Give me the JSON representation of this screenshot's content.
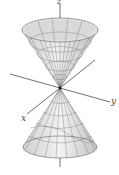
{
  "figure": {
    "type": "double-cone",
    "axes": {
      "z_label": "z",
      "y_label": "y",
      "x_label": "x"
    },
    "colors": {
      "surface_fill": "#d8d8d8",
      "surface_light": "#ececec",
      "mesh": "#6a6a6a",
      "axis": "#333333"
    }
  }
}
